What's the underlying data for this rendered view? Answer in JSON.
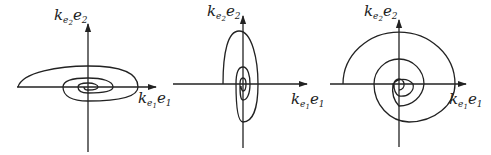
{
  "figure": {
    "stroke_color": "#222222",
    "panels": [
      {
        "id": "panel-1",
        "shape": "horizontally elongated spiral",
        "y_axis_label": {
          "k": "k",
          "sub": "e",
          "subsub": "2",
          "var": "e",
          "var_sub": "2"
        },
        "x_axis_label": {
          "k": "k",
          "sub": "e",
          "subsub": "1",
          "var": "e",
          "var_sub": "1"
        }
      },
      {
        "id": "panel-2",
        "shape": "vertically elongated spiral",
        "y_axis_label": {
          "k": "k",
          "sub": "e",
          "subsub": "2",
          "var": "e",
          "var_sub": "2"
        },
        "x_axis_label": {
          "k": "k",
          "sub": "e",
          "subsub": "1",
          "var": "e",
          "var_sub": "1"
        }
      },
      {
        "id": "panel-3",
        "shape": "circular spiral",
        "y_axis_label": {
          "k": "k",
          "sub": "e",
          "subsub": "2",
          "var": "e",
          "var_sub": "2"
        },
        "x_axis_label": {
          "k": "k",
          "sub": "e",
          "subsub": "1",
          "var": "e",
          "var_sub": "1"
        }
      }
    ]
  }
}
